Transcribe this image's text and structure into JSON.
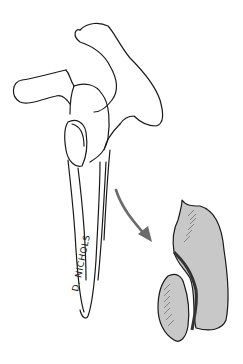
{
  "illustration": {
    "subject": "scapula line drawing with enlarged fracture fragment",
    "signature": "D. NICHOLS",
    "colors": {
      "background": "#ffffff",
      "line": "#1a1a1a",
      "fragment_fill": "#c8c8c8",
      "arrow": "#6b6b6b"
    }
  }
}
